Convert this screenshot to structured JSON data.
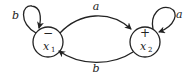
{
  "diagram": {
    "type": "finite-automaton",
    "states": [
      {
        "id": "x1",
        "name": "x",
        "subscript": "1",
        "marker": "−",
        "marker_meaning": "start",
        "self_loop_label": "b"
      },
      {
        "id": "x2",
        "name": "x",
        "subscript": "2",
        "marker": "+",
        "marker_meaning": "final",
        "self_loop_label": "a"
      }
    ],
    "transitions": [
      {
        "from": "x1",
        "to": "x1",
        "label": "b"
      },
      {
        "from": "x1",
        "to": "x2",
        "label": "a"
      },
      {
        "from": "x2",
        "to": "x2",
        "label": "a"
      },
      {
        "from": "x2",
        "to": "x1",
        "label": "b"
      }
    ],
    "colors": {
      "stroke": "#222222",
      "background": "#ffffff"
    }
  }
}
